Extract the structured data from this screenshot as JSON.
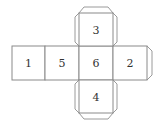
{
  "diagram": {
    "type": "cube-net",
    "faces": [
      {
        "id": "face-1",
        "label": "1",
        "position": "left-outer"
      },
      {
        "id": "face-5",
        "label": "5",
        "position": "left-inner"
      },
      {
        "id": "face-6",
        "label": "6",
        "position": "center"
      },
      {
        "id": "face-2",
        "label": "2",
        "position": "right"
      },
      {
        "id": "face-3",
        "label": "3",
        "position": "top"
      },
      {
        "id": "face-4",
        "label": "4",
        "position": "bottom"
      }
    ],
    "tabs": [
      "top-of-3",
      "left-of-3",
      "right-of-3",
      "bottom-of-4",
      "left-of-4",
      "right-of-4",
      "right-of-2"
    ],
    "colors": {
      "line": "#8a8a8a",
      "text": "#333333",
      "background": "#ffffff"
    }
  }
}
